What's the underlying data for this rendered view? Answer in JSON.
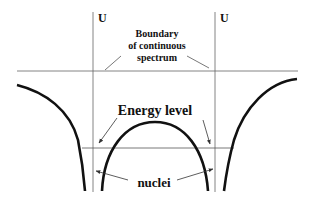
{
  "diagram": {
    "axis_labels": {
      "left": "U",
      "right": "U"
    },
    "boundary_label": {
      "line1": "Boundary",
      "line2": "of continuous",
      "line3": "spectrum"
    },
    "energy_label": "Energy level",
    "nuclei_label": "nuclei",
    "colors": {
      "curve": "#111111",
      "thin_line": "#555555",
      "background": "#ffffff"
    }
  }
}
